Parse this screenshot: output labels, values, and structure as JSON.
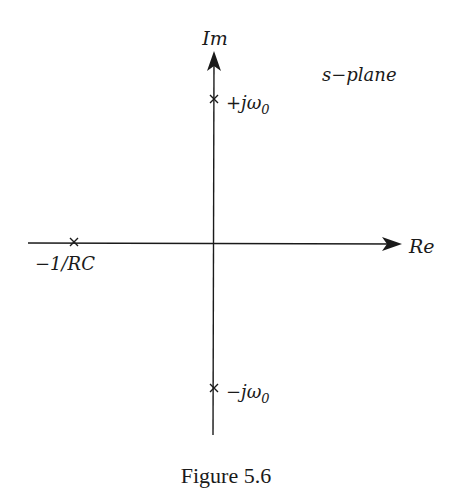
{
  "figure": {
    "caption": "Figure 5.6",
    "plane_label": "s−plane"
  },
  "axes": {
    "real_label": "Re",
    "imag_label": "Im"
  },
  "poles": [
    {
      "label": "+jω",
      "subscript": "0",
      "position": "imaginary-axis-positive"
    },
    {
      "label": "−jω",
      "subscript": "0",
      "position": "imaginary-axis-negative"
    },
    {
      "label": "−1/RC",
      "position": "real-axis-negative"
    }
  ],
  "colors": {
    "ink": "#1a1a1a",
    "background": "#ffffff"
  }
}
